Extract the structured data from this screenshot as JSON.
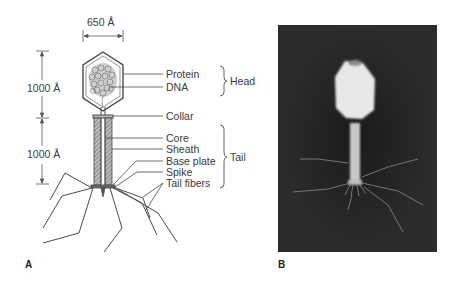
{
  "panel_a": {
    "letter": "A",
    "dimensions": {
      "width": "650 Å",
      "head_height": "1000 Å",
      "tail_height": "1000 Å"
    },
    "labels": {
      "protein": "Protein",
      "dna": "DNA",
      "collar": "Collar",
      "core": "Core",
      "sheath": "Sheath",
      "base_plate": "Base plate",
      "spike": "Spike",
      "tail_fibers": "Tail fibers"
    },
    "groups": {
      "head": "Head",
      "tail": "Tail"
    }
  },
  "panel_b": {
    "letter": "B"
  },
  "colors": {
    "line": "#4a4a4a",
    "photo_bg": "#262626",
    "phage_body": "#e6e6e6"
  }
}
